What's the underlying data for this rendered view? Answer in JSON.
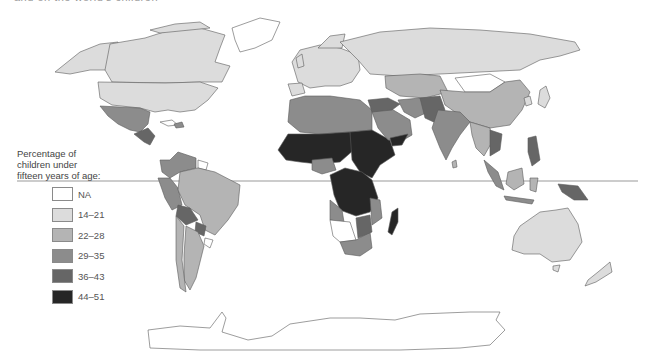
{
  "header": {
    "title_fragment": "and on the world's children"
  },
  "legend": {
    "title_line1": "Percentage of",
    "title_line2": "children under",
    "title_line3": "fifteen years of age:",
    "items": [
      {
        "label": "NA",
        "color": "#ffffff"
      },
      {
        "label": "14–21",
        "color": "#dcdcdc"
      },
      {
        "label": "22–28",
        "color": "#b4b4b4"
      },
      {
        "label": "29–35",
        "color": "#8c8c8c"
      },
      {
        "label": "36–43",
        "color": "#666666"
      },
      {
        "label": "44–51",
        "color": "#262626"
      }
    ]
  },
  "map": {
    "type": "choropleth world map",
    "equator_line": true,
    "regions": [
      {
        "name": "North America (USA, Canada)",
        "class": "14-21"
      },
      {
        "name": "Greenland",
        "class": "NA"
      },
      {
        "name": "Mexico",
        "class": "29-35"
      },
      {
        "name": "Central America",
        "class": "36-43"
      },
      {
        "name": "South America (Brazil, Argentina, Chile)",
        "class": "22-28"
      },
      {
        "name": "Andean countries, Bolivia, Paraguay",
        "class": "29-35 / 36-43"
      },
      {
        "name": "Europe",
        "class": "14-21"
      },
      {
        "name": "Russia",
        "class": "14-21"
      },
      {
        "name": "North Africa",
        "class": "29-35"
      },
      {
        "name": "Sub-Saharan Africa",
        "class": "44-51"
      },
      {
        "name": "Southern Africa",
        "class": "29-35"
      },
      {
        "name": "Madagascar",
        "class": "44-51"
      },
      {
        "name": "Middle East",
        "class": "29-35 / 36-43"
      },
      {
        "name": "South Asia",
        "class": "29-35"
      },
      {
        "name": "China",
        "class": "22-28"
      },
      {
        "name": "Mongolia",
        "class": "NA"
      },
      {
        "name": "Japan",
        "class": "14-21"
      },
      {
        "name": "Southeast Asia",
        "class": "22-28 / 36-43"
      },
      {
        "name": "Australia",
        "class": "14-21"
      },
      {
        "name": "New Zealand",
        "class": "14-21"
      },
      {
        "name": "Antarctica",
        "class": "NA"
      }
    ]
  }
}
